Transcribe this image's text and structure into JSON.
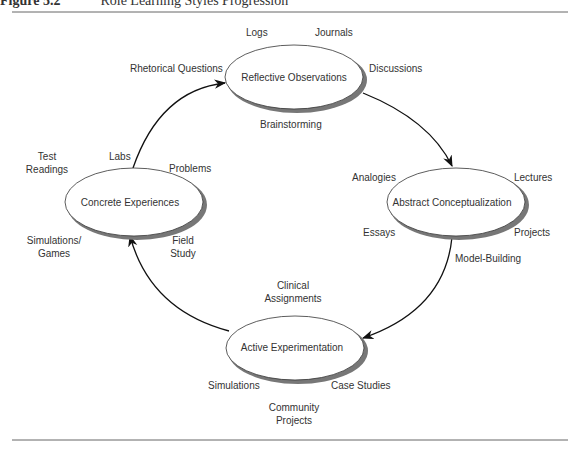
{
  "title": {
    "figure": "Figure 5.2",
    "text": "Role Learning Styles Progression"
  },
  "nodes": [
    {
      "id": "reflective",
      "label": "Reflective Observations"
    },
    {
      "id": "abstract",
      "label": "Abstract Conceptualization"
    },
    {
      "id": "active",
      "label": "Active Experimentation"
    },
    {
      "id": "concrete",
      "label": "Concrete Experiences"
    }
  ],
  "labels": {
    "logs": "Logs",
    "journals": "Journals",
    "rhetorical": "Rhetorical Questions",
    "discussions": "Discussions",
    "brainstorming": "Brainstorming",
    "analogies": "Analogies",
    "lectures": "Lectures",
    "essays": "Essays",
    "projects_r": "Projects",
    "model_building": "Model-Building",
    "clinical_1": "Clinical",
    "clinical_2": "Assignments",
    "simulations": "Simulations",
    "case_studies": "Case Studies",
    "community_1": "Community",
    "community_2": "Projects",
    "test_1": "Test",
    "test_2": "Readings",
    "labs": "Labs",
    "problems": "Problems",
    "simgames_1": "Simulations/",
    "simgames_2": "Games",
    "field_1": "Field",
    "field_2": "Study"
  }
}
